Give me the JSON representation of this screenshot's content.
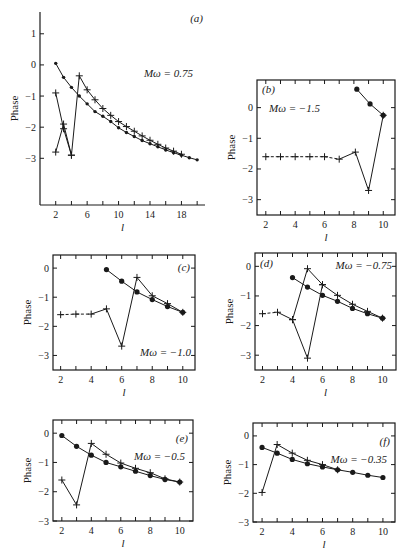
{
  "figure": {
    "ylabel": "Phase",
    "xlabel": "l"
  },
  "chart_data": [
    {
      "id": "a",
      "type": "line",
      "panel_label": "(a)",
      "annotation": "Mω = 0.75",
      "xlabel": "l",
      "ylabel": "Phase",
      "frame": "open",
      "xlim": [
        0,
        21
      ],
      "ylim": [
        -4.5,
        1.7
      ],
      "xticks": [
        2,
        6,
        10,
        14,
        18
      ],
      "xminor": [
        2,
        4,
        6,
        8,
        10,
        12,
        14,
        16,
        18,
        20
      ],
      "yticks": [
        1,
        0,
        -1,
        -2,
        -3
      ],
      "box": {
        "left": 40,
        "top": 12,
        "right": 205,
        "bottom": 205
      },
      "series": [
        {
          "name": "dots",
          "marker": "dot",
          "segments": [
            [
              [
                2,
                0.05
              ],
              [
                3,
                -0.4
              ],
              [
                4,
                -0.72
              ],
              [
                5,
                -1.0
              ],
              [
                6,
                -1.25
              ],
              [
                7,
                -1.5
              ],
              [
                8,
                -1.65
              ],
              [
                9,
                -1.82
              ],
              [
                10,
                -2.02
              ],
              [
                11,
                -2.17
              ],
              [
                12,
                -2.3
              ],
              [
                13,
                -2.43
              ],
              [
                14,
                -2.53
              ],
              [
                15,
                -2.63
              ],
              [
                16,
                -2.73
              ],
              [
                17,
                -2.82
              ],
              [
                18,
                -2.9
              ],
              [
                19,
                -2.98
              ],
              [
                20,
                -3.05
              ]
            ]
          ]
        },
        {
          "name": "crosses",
          "marker": "cross",
          "segments": [
            [
              [
                2,
                -0.9
              ],
              [
                3,
                -2.05
              ],
              [
                4,
                -2.9
              ],
              [
                5,
                -0.35
              ],
              [
                6,
                -0.8
              ],
              [
                7,
                -1.12
              ],
              [
                8,
                -1.4
              ],
              [
                9,
                -1.62
              ],
              [
                10,
                -1.82
              ],
              [
                11,
                -1.98
              ],
              [
                12,
                -2.13
              ],
              [
                13,
                -2.28
              ],
              [
                14,
                -2.42
              ],
              [
                15,
                -2.55
              ],
              [
                16,
                -2.67
              ],
              [
                17,
                -2.77
              ],
              [
                18,
                -2.87
              ]
            ],
            [
              [
                2,
                -2.8
              ],
              [
                3,
                -1.9
              ],
              [
                4,
                -2.9
              ]
            ]
          ]
        }
      ]
    },
    {
      "id": "b",
      "type": "line",
      "panel_label": "(b)",
      "annotation": "Mω = −1.5",
      "xlabel": "l",
      "ylabel": "Phase",
      "frame": "box",
      "xlim": [
        1.4,
        10.8
      ],
      "ylim": [
        -3.5,
        0.9
      ],
      "xticks": [
        2,
        4,
        6,
        8,
        10
      ],
      "xminor": [
        2,
        3,
        4,
        5,
        6,
        7,
        8,
        9,
        10
      ],
      "yticks": [
        0,
        -1,
        -2,
        -3
      ],
      "box": {
        "left": 257,
        "top": 80,
        "right": 395,
        "bottom": 215
      },
      "series": [
        {
          "name": "dots",
          "marker": "dot",
          "segments": [
            [
              [
                8.2,
                0.6
              ],
              [
                9.1,
                0.12
              ],
              [
                10,
                -0.25
              ]
            ]
          ]
        },
        {
          "name": "crosses",
          "marker": "cross",
          "dashed_until": 7,
          "segments": [
            [
              [
                2,
                -1.6
              ],
              [
                3,
                -1.6
              ],
              [
                4,
                -1.6
              ],
              [
                5,
                -1.6
              ],
              [
                6,
                -1.6
              ],
              [
                7,
                -1.68
              ],
              [
                8.1,
                -1.45
              ],
              [
                9,
                -2.7
              ],
              [
                10,
                -0.25
              ]
            ]
          ]
        }
      ]
    },
    {
      "id": "c",
      "type": "line",
      "panel_label": "(c)",
      "annotation": "Mω = −1.0",
      "xlabel": "l",
      "ylabel": "Phase",
      "frame": "box",
      "xlim": [
        1.5,
        10.8
      ],
      "ylim": [
        -3.5,
        0.45
      ],
      "xticks": [
        2,
        4,
        6,
        8,
        10
      ],
      "xminor": [
        2,
        3,
        4,
        5,
        6,
        7,
        8,
        9,
        10
      ],
      "yticks": [
        0,
        -1,
        -2,
        -3
      ],
      "box": {
        "left": 53,
        "top": 255,
        "right": 195,
        "bottom": 370
      },
      "series": [
        {
          "name": "dots",
          "marker": "dot",
          "segments": [
            [
              [
                5,
                -0.05
              ],
              [
                6,
                -0.45
              ],
              [
                7,
                -0.82
              ],
              [
                8,
                -1.08
              ],
              [
                9,
                -1.32
              ],
              [
                10,
                -1.52
              ]
            ]
          ]
        },
        {
          "name": "crosses",
          "marker": "cross",
          "dashed_until": 4,
          "segments": [
            [
              [
                2,
                -1.6
              ],
              [
                3,
                -1.58
              ],
              [
                4,
                -1.58
              ],
              [
                5,
                -1.4
              ],
              [
                6,
                -2.68
              ],
              [
                7,
                -0.32
              ],
              [
                8,
                -0.95
              ],
              [
                9,
                -1.22
              ],
              [
                10,
                -1.52
              ]
            ]
          ]
        }
      ]
    },
    {
      "id": "d",
      "type": "line",
      "panel_label": "(d)",
      "annotation": "Mω = −0.75",
      "xlabel": "l",
      "ylabel": "Phase",
      "frame": "box",
      "xlim": [
        1.5,
        10.9
      ],
      "ylim": [
        -3.5,
        0.45
      ],
      "xticks": [
        2,
        4,
        6,
        8,
        10
      ],
      "xminor": [
        2,
        3,
        4,
        5,
        6,
        7,
        8,
        9,
        10
      ],
      "yticks": [
        0,
        -1,
        -2,
        -3
      ],
      "box": {
        "left": 255,
        "top": 253,
        "right": 396,
        "bottom": 370
      },
      "series": [
        {
          "name": "dots",
          "marker": "dot",
          "segments": [
            [
              [
                4,
                -0.38
              ],
              [
                5,
                -0.7
              ],
              [
                6,
                -0.98
              ],
              [
                7,
                -1.18
              ],
              [
                8,
                -1.42
              ],
              [
                9,
                -1.6
              ],
              [
                10,
                -1.75
              ]
            ]
          ]
        },
        {
          "name": "crosses",
          "marker": "cross",
          "dashed_until": 3,
          "segments": [
            [
              [
                2,
                -1.6
              ],
              [
                3,
                -1.55
              ],
              [
                4,
                -1.8
              ],
              [
                5,
                -0.08
              ],
              [
                6,
                -0.62
              ],
              [
                7,
                -0.98
              ],
              [
                8,
                -1.28
              ],
              [
                9,
                -1.52
              ],
              [
                10,
                -1.75
              ]
            ],
            [
              [
                4,
                -1.8
              ],
              [
                5,
                -3.1
              ],
              [
                6,
                -0.62
              ]
            ]
          ]
        }
      ]
    },
    {
      "id": "e",
      "type": "line",
      "panel_label": "(e)",
      "annotation": "Mω = −0.5",
      "xlabel": "l",
      "ylabel": "Phase",
      "frame": "box",
      "xlim": [
        1.4,
        10.9
      ],
      "ylim": [
        -3.0,
        0.45
      ],
      "xticks": [
        2,
        4,
        6,
        8,
        10
      ],
      "xminor": [
        2,
        3,
        4,
        5,
        6,
        7,
        8,
        9,
        10
      ],
      "yticks": [
        0,
        -1,
        -2,
        -3
      ],
      "box": {
        "left": 53,
        "top": 420,
        "right": 193,
        "bottom": 521
      },
      "series": [
        {
          "name": "dots",
          "marker": "dot",
          "segments": [
            [
              [
                2,
                -0.08
              ],
              [
                3,
                -0.45
              ],
              [
                4,
                -0.75
              ],
              [
                5,
                -1.0
              ],
              [
                6,
                -1.15
              ],
              [
                7,
                -1.3
              ],
              [
                8,
                -1.45
              ],
              [
                9,
                -1.58
              ],
              [
                10,
                -1.67
              ]
            ]
          ]
        },
        {
          "name": "crosses",
          "marker": "cross",
          "segments": [
            [
              [
                2,
                -1.6
              ],
              [
                3,
                -2.45
              ],
              [
                4,
                -0.35
              ],
              [
                5,
                -0.72
              ],
              [
                6,
                -1.02
              ],
              [
                7,
                -1.2
              ],
              [
                8,
                -1.35
              ],
              [
                9,
                -1.56
              ],
              [
                10,
                -1.67
              ]
            ]
          ]
        }
      ]
    },
    {
      "id": "f",
      "type": "line",
      "panel_label": "(f)",
      "annotation": "Mω = −0.35",
      "xlabel": "l",
      "ylabel": "Phase",
      "frame": "box",
      "xlim": [
        1.4,
        10.8
      ],
      "ylim": [
        -3.0,
        0.45
      ],
      "xticks": [
        2,
        4,
        6,
        8,
        10
      ],
      "xminor": [
        2,
        3,
        4,
        5,
        6,
        7,
        8,
        9,
        10
      ],
      "yticks": [
        0,
        -1,
        -2,
        -3
      ],
      "box": {
        "left": 253,
        "top": 423,
        "right": 395,
        "bottom": 522
      },
      "series": [
        {
          "name": "dots",
          "marker": "dot",
          "segments": [
            [
              [
                2,
                -0.4
              ],
              [
                3,
                -0.6
              ],
              [
                4,
                -0.82
              ],
              [
                5,
                -0.97
              ],
              [
                6,
                -1.08
              ],
              [
                7,
                -1.18
              ],
              [
                8,
                -1.27
              ],
              [
                9,
                -1.37
              ],
              [
                10,
                -1.45
              ]
            ]
          ]
        },
        {
          "name": "crosses",
          "marker": "cross",
          "segments": [
            [
              [
                2,
                -1.97
              ],
              [
                3,
                -0.3
              ],
              [
                4,
                -0.6
              ],
              [
                5,
                -0.85
              ],
              [
                6,
                -1.0
              ],
              [
                7,
                -1.18
              ]
            ]
          ]
        }
      ]
    }
  ]
}
